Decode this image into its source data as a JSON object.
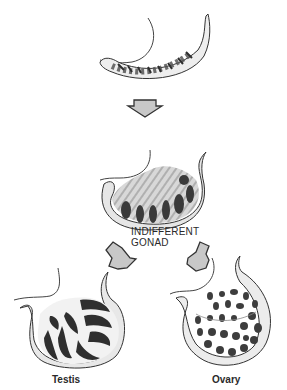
{
  "diagram": {
    "type": "developmental-sequence",
    "stages": [
      {
        "id": "early-gonadal-ridge",
        "label": ""
      },
      {
        "id": "indifferent-gonad",
        "label": "INDIFFERENT\nGONAD"
      },
      {
        "id": "testis",
        "label": "Testis"
      },
      {
        "id": "ovary",
        "label": "Ovary"
      }
    ],
    "labels": {
      "indifferent_line1": "INDIFFERENT",
      "indifferent_line2": "GONAD",
      "testis": "Testis",
      "ovary": "Ovary"
    },
    "arrows": [
      {
        "from": "early-gonadal-ridge",
        "to": "indifferent-gonad",
        "direction": "down"
      },
      {
        "from": "indifferent-gonad",
        "to": "testis",
        "direction": "down-left"
      },
      {
        "from": "indifferent-gonad",
        "to": "ovary",
        "direction": "down-right"
      }
    ],
    "colors": {
      "arrow_fill": "#c8c8c8",
      "arrow_stroke": "#333333",
      "tissue_dark": "#3a3a3a",
      "tissue_mid": "#8a8a8a",
      "outline": "#4a4a4a"
    }
  }
}
